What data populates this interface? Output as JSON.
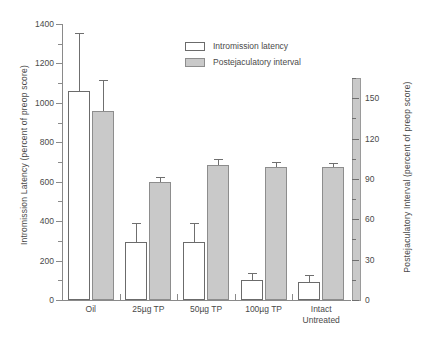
{
  "chart_data": {
    "type": "bar",
    "title": "",
    "categories": [
      "Oil",
      "25µg TP",
      "50µg TP",
      "100µg TP",
      "Intact\nUntreated"
    ],
    "series": [
      {
        "name": "Intromission latency",
        "axis": "left",
        "style": "open",
        "values": [
          1060,
          295,
          295,
          100,
          90
        ],
        "errors_upper": [
          1355,
          390,
          390,
          135,
          125
        ]
      },
      {
        "name": "Postejaculatory interval",
        "axis": "right",
        "style": "filled",
        "values": [
          960,
          600,
          685,
          675,
          675
        ],
        "errors_upper": [
          1115,
          625,
          715,
          700,
          695
        ]
      }
    ],
    "xlabel": "",
    "ylabel": "Intromission Latency (percent of preop score)",
    "ylabel_right": "Postejaculatory Interval (percent of preop score)",
    "ylim": [
      0,
      1400
    ],
    "yticks": [
      0,
      200,
      400,
      600,
      800,
      1000,
      1200,
      1400
    ],
    "yticks_minor": [
      100,
      300,
      500,
      700,
      900,
      1100,
      1300
    ],
    "ylim_right": [
      0,
      165
    ],
    "yticks_right": [
      0,
      30,
      60,
      90,
      120,
      150
    ],
    "yticks_right_minor": [
      15,
      45,
      75,
      105,
      135,
      165
    ],
    "grid": false,
    "legend_position": "top-center",
    "legend": [
      "Intromission latency",
      "Postejaculatory interval"
    ],
    "colors": {
      "open_fill": "#ffffff",
      "open_border": "#6b6b6b",
      "filled_fill": "#c9c9c9",
      "filled_border": "#8d8d8d",
      "axis": "#8a8a8a",
      "text": "#4a4a4a"
    }
  }
}
